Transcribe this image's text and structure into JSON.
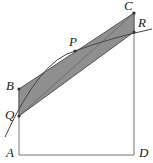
{
  "figure": {
    "labels": {
      "A": "A",
      "B": "B",
      "C": "C",
      "D": "D",
      "P": "P",
      "Q": "Q",
      "R": "R"
    },
    "colors": {
      "shade": "#8c8c8c",
      "line": "#555555",
      "curve": "#444444",
      "point": "#333333"
    }
  }
}
